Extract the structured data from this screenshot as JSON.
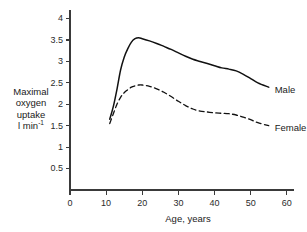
{
  "chart_data": {
    "type": "line",
    "title": "",
    "xlabel": "Age, years",
    "ylabel": "Maximal oxygen uptake l min",
    "ylabel_lines": [
      "Maximal",
      "oxygen",
      "uptake"
    ],
    "ylabel_unit": "l min",
    "ylabel_unit_exponent": "-1",
    "xlim": [
      0,
      62
    ],
    "ylim": [
      0,
      4.2
    ],
    "xticks": [
      0,
      10,
      20,
      30,
      40,
      50,
      60
    ],
    "xticklabels": [
      "0",
      "10",
      "20",
      "30",
      "40",
      "50",
      "60"
    ],
    "yticks": [
      0.5,
      1,
      1.5,
      2,
      2.5,
      3,
      3.5,
      4
    ],
    "yticklabels": [
      "0.5",
      "1",
      "1.5",
      "2",
      "2.5",
      "3",
      "3.5",
      "4"
    ],
    "grid": false,
    "legend_position": "inline-right",
    "series": [
      {
        "name": "Male",
        "style": "solid",
        "color": "#111111",
        "label": "Male",
        "x": [
          11,
          12,
          13,
          14,
          15,
          16,
          17,
          18,
          19,
          20,
          22,
          24,
          26,
          28,
          30,
          32,
          34,
          36,
          38,
          40,
          42,
          44,
          46,
          48,
          50,
          52,
          55
        ],
        "y": [
          1.65,
          1.95,
          2.35,
          2.8,
          3.1,
          3.3,
          3.45,
          3.53,
          3.55,
          3.53,
          3.48,
          3.42,
          3.35,
          3.28,
          3.2,
          3.12,
          3.05,
          3.0,
          2.95,
          2.9,
          2.85,
          2.82,
          2.78,
          2.7,
          2.6,
          2.5,
          2.4
        ]
      },
      {
        "name": "Female",
        "style": "dashed",
        "color": "#111111",
        "label": "Female",
        "x": [
          11,
          12,
          13,
          14,
          15,
          16,
          17,
          18,
          19,
          20,
          22,
          24,
          26,
          28,
          30,
          32,
          34,
          36,
          38,
          40,
          42,
          44,
          46,
          48,
          50,
          52,
          55
        ],
        "y": [
          1.55,
          1.78,
          2.0,
          2.16,
          2.27,
          2.34,
          2.4,
          2.43,
          2.45,
          2.45,
          2.42,
          2.36,
          2.28,
          2.18,
          2.07,
          1.97,
          1.89,
          1.84,
          1.82,
          1.8,
          1.79,
          1.78,
          1.75,
          1.7,
          1.64,
          1.57,
          1.5
        ]
      }
    ]
  }
}
